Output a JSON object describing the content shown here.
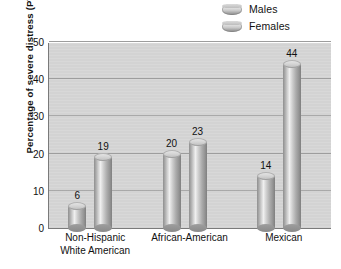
{
  "chart_data": {
    "type": "bar",
    "title": "",
    "subtitle": "",
    "xlabel": "",
    "ylabel": "Percentage of severe distress (PTSD)",
    "categories": [
      "Non-Hispanic White American",
      "African-American",
      "Mexican"
    ],
    "category_lines": [
      [
        "Non-Hispanic",
        "White American"
      ],
      [
        "African-American"
      ],
      [
        "Mexican"
      ]
    ],
    "series": [
      {
        "name": "Males",
        "values": [
          6,
          20,
          14
        ]
      },
      {
        "name": "Females",
        "values": [
          19,
          23,
          44
        ]
      }
    ],
    "ylim": [
      0,
      50
    ],
    "ytick_values": [
      0,
      10,
      20,
      30,
      40,
      50
    ],
    "ytick_labels": [
      "0",
      "10",
      "20",
      "30",
      "40",
      "50"
    ],
    "grid": "horizontal",
    "legend_position": "top-right",
    "data_labels": true,
    "colors": {
      "plot_background": "#d3d3d3",
      "gridline": "#9d9d9d",
      "axis": "#7a7a7a",
      "bar_light": "#efefef",
      "bar_mid": "#cfcfcf",
      "bar_dark": "#7f7f7f",
      "text": "#111111"
    }
  },
  "legend": {
    "items": [
      {
        "label": "Males",
        "swatch": "cylinder-swatch-males"
      },
      {
        "label": "Females",
        "swatch": "cylinder-swatch-females"
      }
    ]
  }
}
